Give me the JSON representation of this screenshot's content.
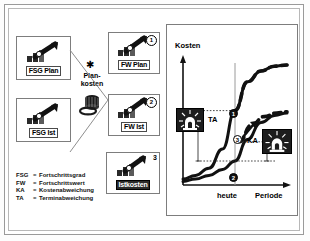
{
  "diagram": {
    "left_nodes": [
      {
        "id": "fsg-plan",
        "caption": "FSG Plan",
        "icon": "bar-chart-arrow-icon",
        "badge": ""
      },
      {
        "id": "fsg-ist",
        "caption": "FSG Ist",
        "icon": "bar-chart-arrow-icon",
        "badge": ""
      }
    ],
    "right_nodes": [
      {
        "id": "fw-plan",
        "caption": "FW Plan",
        "icon": "bar-chart-arrow-icon",
        "badge": "1"
      },
      {
        "id": "fw-ist",
        "caption": "FW Ist",
        "icon": "bar-chart-arrow-icon",
        "badge": "2"
      },
      {
        "id": "istkosten",
        "caption": "Istkosten",
        "icon": "bar-chart-arrow-icon",
        "badge": "3"
      }
    ],
    "center": {
      "star": "✱",
      "label_line1": "Plan-",
      "label_line2": "kosten",
      "icon": "money-bag-coins-icon"
    },
    "legend": [
      {
        "abbr": "FSG",
        "eq": "=",
        "text": "Fortschrittsgrad"
      },
      {
        "abbr": "FW",
        "eq": "=",
        "text": "Fortschrittswert"
      },
      {
        "abbr": "KA",
        "eq": "=",
        "text": "Kostenabweichung"
      },
      {
        "abbr": "TA",
        "eq": "=",
        "text": "Terminabweichung"
      }
    ]
  },
  "chart_data": {
    "type": "line",
    "title": "",
    "ylabel": "Kosten",
    "xlabel": "Periode",
    "grid": false,
    "legend_position": "none",
    "annotations": [
      {
        "name": "TA",
        "label": "TA",
        "meaning": "Terminabweichung"
      },
      {
        "name": "KA",
        "label": "KA",
        "meaning": "Kostenabweichung"
      },
      {
        "name": "heute",
        "label": "heute",
        "meaning": "today marker on x-axis"
      }
    ],
    "markers": [
      {
        "label": "1",
        "x": 0.5,
        "y": 0.62,
        "style": "filled"
      },
      {
        "label": "2",
        "x": 0.5,
        "y": 0.2,
        "style": "filled"
      },
      {
        "label": "3",
        "x": 0.54,
        "y": 0.36,
        "style": "open"
      }
    ],
    "series": [
      {
        "name": "Plankosten",
        "style": "solid",
        "x": [
          0.0,
          0.12,
          0.25,
          0.38,
          0.5,
          0.62,
          0.75,
          0.88,
          1.0
        ],
        "y": [
          0.05,
          0.08,
          0.14,
          0.3,
          0.62,
          0.86,
          0.95,
          0.99,
          1.0
        ]
      },
      {
        "name": "Istkosten",
        "style": "solid",
        "x": [
          0.0,
          0.12,
          0.25,
          0.38,
          0.5,
          0.62,
          0.75,
          0.88,
          1.0
        ],
        "y": [
          0.03,
          0.05,
          0.08,
          0.13,
          0.2,
          0.38,
          0.52,
          0.58,
          0.6
        ]
      },
      {
        "name": "Plankosten-Prognose",
        "style": "dashed",
        "x": [
          0.5,
          0.62,
          0.75,
          0.88,
          1.0
        ],
        "y": [
          0.62,
          0.86,
          0.95,
          0.99,
          1.0
        ]
      },
      {
        "name": "Istkosten-Prognose",
        "style": "dashed",
        "x": [
          0.54,
          0.66,
          0.78,
          0.9,
          1.0
        ],
        "y": [
          0.36,
          0.5,
          0.57,
          0.6,
          0.61
        ]
      }
    ],
    "xlim": [
      0,
      1
    ],
    "ylim": [
      0,
      1
    ],
    "today_x": 0.5
  }
}
